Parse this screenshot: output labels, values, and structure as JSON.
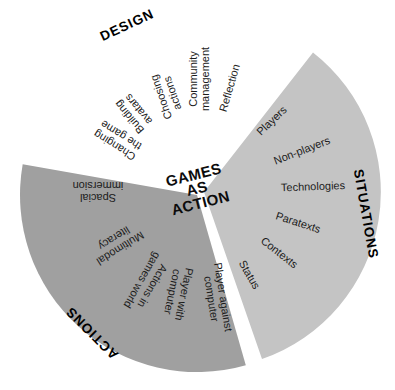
{
  "diagram": {
    "center_title": "GAMES\nAS\nACTION",
    "text_color": "#1b1b1b",
    "segments": [
      {
        "label": "DESIGN",
        "color": "#ffffff",
        "items": [
          "Changing\nthe game",
          "Building\navatars",
          "Choosing\nactions",
          "Community\nmanagement",
          "Reflection"
        ]
      },
      {
        "label": "SITUATIONS",
        "color": "#c4c4c4",
        "items": [
          "Players",
          "Non-players",
          "Technologies",
          "Paratexts",
          "Contexts",
          "Status"
        ]
      },
      {
        "label": "ACTIONS",
        "color": "#a0a0a0",
        "items": [
          "Spacial\nimmersion",
          "Multimodal\nliteracy",
          "Actions in\ngames world",
          "Player with\ncomputer",
          "Player against\ncomputer"
        ]
      }
    ]
  }
}
